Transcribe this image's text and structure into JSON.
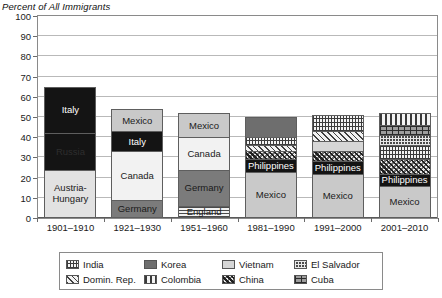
{
  "chart_data": {
    "type": "bar",
    "stacked": true,
    "title": "Percent of All Immigrants",
    "ylabel": "Percent of All Immigrants",
    "xlabel": "",
    "ylim": [
      0,
      100
    ],
    "ytick_step": 10,
    "yticks": [
      "100",
      "90",
      "80",
      "70",
      "60",
      "50",
      "40",
      "30",
      "20",
      "10",
      "0"
    ],
    "categories": [
      "1901–1910",
      "1921–1930",
      "1951–1960",
      "1981–1990",
      "1991–2000",
      "2001–2010"
    ],
    "grid": true,
    "legend_position": "bottom",
    "bars": [
      {
        "period": "1901–1910",
        "total": 65,
        "segments": [
          {
            "label": "Austria-Hungary",
            "value": 24,
            "fill": "f-light",
            "labeled": true
          },
          {
            "label": "Russia",
            "value": 18,
            "fill": "f-solid-black f-label-dark-on-black",
            "labeled": true
          },
          {
            "label": "Italy",
            "value": 23,
            "fill": "f-solid-black",
            "labeled": true
          }
        ]
      },
      {
        "period": "1921–1930",
        "total": 54,
        "segments": [
          {
            "label": "Germany",
            "value": 9,
            "fill": "f-darkgray",
            "labeled": true
          },
          {
            "label": "Canada",
            "value": 24,
            "fill": "f-lightest",
            "labeled": true
          },
          {
            "label": "Italy",
            "value": 10,
            "fill": "f-solid-black",
            "labeled": true
          },
          {
            "label": "Mexico",
            "value": 11,
            "fill": "f-mid",
            "labeled": true
          }
        ]
      },
      {
        "period": "1951–1960",
        "total": 52,
        "segments": [
          {
            "label": "England",
            "value": 6,
            "fill": "f-england",
            "labeled": true
          },
          {
            "label": "Germany",
            "value": 18,
            "fill": "f-darkgray",
            "labeled": true
          },
          {
            "label": "Canada",
            "value": 16,
            "fill": "f-lightest",
            "labeled": true
          },
          {
            "label": "Mexico",
            "value": 12,
            "fill": "f-mid",
            "labeled": true
          }
        ]
      },
      {
        "period": "1981–1990",
        "total": 50,
        "segments": [
          {
            "label": "Mexico",
            "value": 23,
            "fill": "f-mid",
            "labeled": true
          },
          {
            "label": "Philippines",
            "value": 6,
            "fill": "f-solid-black",
            "labeled": true
          },
          {
            "label": "China",
            "value": 4,
            "fill": "f-china",
            "labeled": false
          },
          {
            "label": "Domin. Rep.",
            "value": 3,
            "fill": "f-domrep",
            "labeled": false
          },
          {
            "label": "India",
            "value": 4,
            "fill": "f-india",
            "labeled": false
          },
          {
            "label": "Korea",
            "value": 10,
            "fill": "f-korea",
            "labeled": false
          }
        ]
      },
      {
        "period": "1991–2000",
        "total": 51,
        "segments": [
          {
            "label": "Mexico",
            "value": 22,
            "fill": "f-mid",
            "labeled": true
          },
          {
            "label": "Philippines",
            "value": 6,
            "fill": "f-solid-black",
            "labeled": true
          },
          {
            "label": "China",
            "value": 5,
            "fill": "f-china",
            "labeled": false
          },
          {
            "label": "Vietnam",
            "value": 5,
            "fill": "f-vietnam",
            "labeled": false
          },
          {
            "label": "Domin. Rep.",
            "value": 5,
            "fill": "f-domrep",
            "labeled": false
          },
          {
            "label": "India",
            "value": 8,
            "fill": "f-india",
            "labeled": false
          }
        ]
      },
      {
        "period": "2001–2010",
        "total": 52,
        "segments": [
          {
            "label": "Mexico",
            "value": 16,
            "fill": "f-mid",
            "labeled": true
          },
          {
            "label": "Philippines",
            "value": 6,
            "fill": "f-solid-black",
            "labeled": true
          },
          {
            "label": "China",
            "value": 7,
            "fill": "f-china",
            "labeled": false
          },
          {
            "label": "India",
            "value": 7,
            "fill": "f-india",
            "labeled": false
          },
          {
            "label": "El Salvador",
            "value": 5,
            "fill": "f-elsalvador",
            "labeled": false
          },
          {
            "label": "Cuba",
            "value": 5,
            "fill": "f-cuba",
            "labeled": false
          },
          {
            "label": "Colombia",
            "value": 6,
            "fill": "f-colombia",
            "labeled": false
          }
        ]
      }
    ],
    "legend": [
      {
        "label": "India",
        "fill": "f-india"
      },
      {
        "label": "Korea",
        "fill": "f-korea"
      },
      {
        "label": "Vietnam",
        "fill": "f-vietnam"
      },
      {
        "label": "El Salvador",
        "fill": "f-elsalvador"
      },
      {
        "label": "Domin. Rep.",
        "fill": "f-domrep"
      },
      {
        "label": "Colombia",
        "fill": "f-colombia"
      },
      {
        "label": "China",
        "fill": "f-china"
      },
      {
        "label": "Cuba",
        "fill": "f-cuba"
      }
    ]
  }
}
